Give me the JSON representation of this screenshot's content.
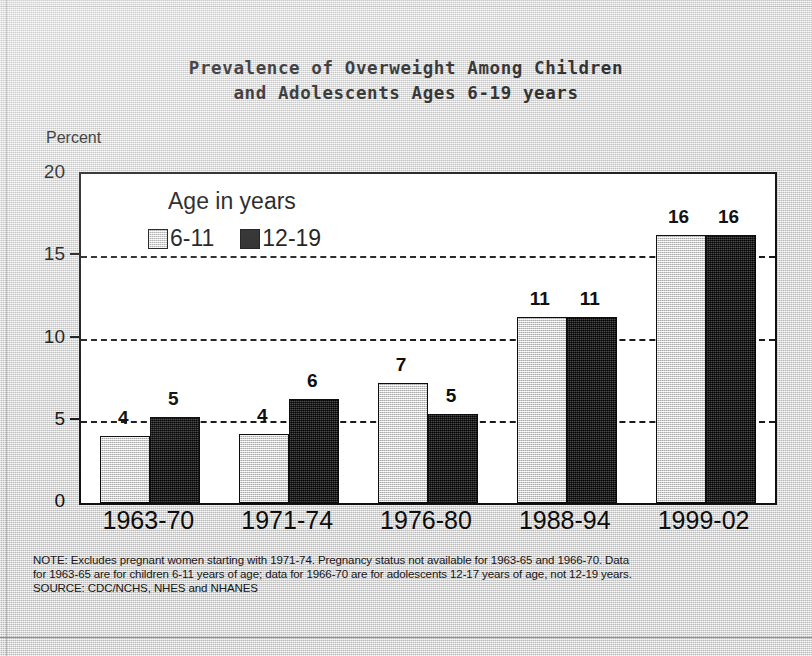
{
  "title": {
    "line1": "Prevalence of Overweight Among Children",
    "line2": "and Adolescents Ages 6-19 years"
  },
  "axis": {
    "ylabel": "Percent",
    "yticks": [
      "0",
      "5",
      "10",
      "15",
      "20"
    ]
  },
  "legend": {
    "title": "Age in years",
    "series": [
      {
        "label": "6-11",
        "swatch": "light-gray"
      },
      {
        "label": "12-19",
        "swatch": "dark-black"
      }
    ]
  },
  "notes": {
    "line1": "NOTE:  Excludes pregnant women starting with 1971-74.  Pregnancy status not available for 1963-65 and 1966-70.  Data",
    "line2": "for 1963-65 are for children 6-11 years of age; data for 1966-70 are for adolescents 12-17 years of age, not 12-19 years.",
    "line3": "SOURCE: CDC/NCHS, NHES and NHANES"
  },
  "chart_data": {
    "type": "bar",
    "title": "Prevalence of Overweight Among Children and Adolescents Ages 6-19 years",
    "xlabel": "",
    "ylabel": "Percent",
    "ylim": [
      0,
      20
    ],
    "yticks": [
      0,
      5,
      10,
      15,
      20
    ],
    "grid": "horizontal-dashed",
    "legend_position": "inside-upper-left",
    "categories": [
      "1963-70",
      "1971-74",
      "1976-80",
      "1988-94",
      "1999-02"
    ],
    "series": [
      {
        "name": "6-11",
        "color": "#d5d5d5",
        "values": [
          4.1,
          4.2,
          7.3,
          11.3,
          16.3
        ],
        "labels": [
          "4",
          "4",
          "7",
          "11",
          "16"
        ]
      },
      {
        "name": "12-19",
        "color": "#1e1e1e",
        "values": [
          5.2,
          6.3,
          5.4,
          11.3,
          16.3
        ],
        "labels": [
          "5",
          "6",
          "5",
          "11",
          "16"
        ]
      }
    ]
  }
}
